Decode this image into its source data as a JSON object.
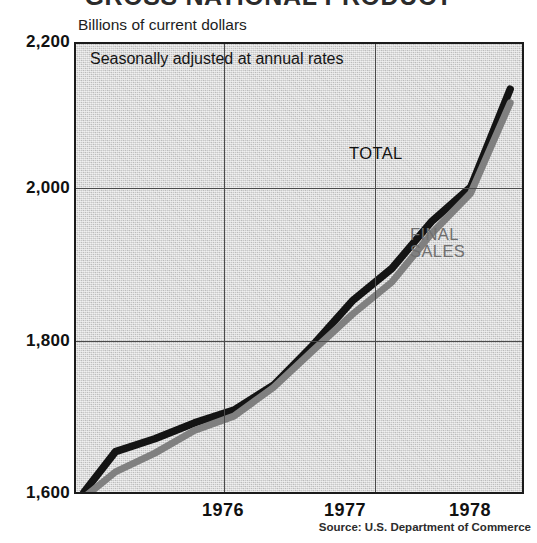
{
  "chart_data": {
    "type": "line",
    "title": "GROSS NATIONAL PRODUCT",
    "subtitle": "Billions of current dollars",
    "note": "Seasonally adjusted at annual rates",
    "source": "Source: U.S. Department of Commerce",
    "xlabel": "",
    "ylabel": "Billions of current dollars",
    "ylim": [
      1600,
      2200
    ],
    "xlim": [
      1975.75,
      1978.6
    ],
    "y_ticks": [
      "1,600",
      "1,800",
      "2,000",
      "2,200"
    ],
    "y_tick_values": [
      1600,
      1800,
      2000,
      2200
    ],
    "x_ticks": [
      "1976",
      "1977",
      "1978"
    ],
    "x_tick_values": [
      1976.5,
      1977.5,
      1978.5
    ],
    "grid": true,
    "legend_position": "inline-annotation",
    "colors": {
      "total": "#141414",
      "final_sales": "#808080",
      "plot_background": "#c8c8c8",
      "frame": "#1b1b1b",
      "gridline": "#4a4a4a"
    },
    "x": [
      1975.8,
      1976.0,
      1976.25,
      1976.5,
      1976.75,
      1977.0,
      1977.25,
      1977.5,
      1977.75,
      1978.0,
      1978.25,
      1978.5
    ],
    "series": [
      {
        "name": "TOTAL",
        "color": "#141414",
        "values": [
          1605,
          1659,
          1676,
          1697,
          1714,
          1747,
          1800,
          1859,
          1902,
          1964,
          2010,
          2140
        ]
      },
      {
        "name": "FINAL SALES",
        "color": "#808080",
        "values": [
          1598,
          1632,
          1657,
          1687,
          1706,
          1744,
          1793,
          1841,
          1884,
          1948,
          2002,
          2122
        ]
      }
    ],
    "annotations": [
      {
        "name": "total",
        "text": "TOTAL"
      },
      {
        "name": "final-sales",
        "line1": "FINAL",
        "line2": "SALES"
      }
    ]
  }
}
